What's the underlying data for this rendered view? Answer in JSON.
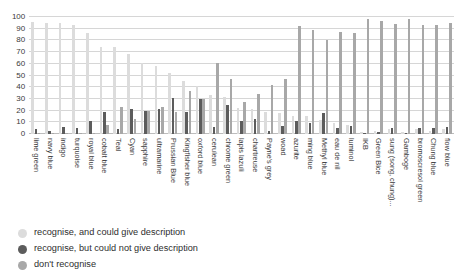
{
  "chart_data": {
    "type": "bar",
    "title": "",
    "subtitle": "",
    "xlabel": "",
    "ylabel": "",
    "ylim": [
      0,
      100
    ],
    "yticks": [
      0,
      10,
      20,
      30,
      40,
      50,
      60,
      70,
      80,
      90,
      100
    ],
    "grid": true,
    "legend_position": "bottom-left",
    "orientation": "vertical",
    "grouping": "grouped",
    "categories": [
      "lime green",
      "navy blue",
      "indigo",
      "turquoise",
      "royal blue",
      "cobalt blue",
      "Teal",
      "Cyan",
      "sapphire",
      "ultramarine",
      "Prussian Blue",
      "Kingfisher blue",
      "oxford blue",
      "cerulean",
      "chrome green",
      "lapis lazuli",
      "chartreuse",
      "Payne's grey",
      "woad",
      "azurite",
      "ming blue",
      "Methyl blue",
      "eau de nil",
      "luminol",
      "IKB",
      "Green Bice",
      "sung (song, chung)...",
      "Gamboge",
      "bromoscresol green",
      "Chung blue",
      "flow blue"
    ],
    "series": [
      {
        "name": "recognise, and could give description",
        "color": "#dcdcdc",
        "values": [
          96,
          95,
          95,
          93,
          86,
          74,
          74,
          68,
          61,
          58,
          52,
          45,
          41,
          33,
          32,
          22,
          21,
          19,
          18,
          15,
          15,
          12,
          9,
          8,
          2,
          3,
          4,
          2,
          4,
          3,
          4
        ]
      },
      {
        "name": "recognise, but could not give description",
        "color": "#5c5c5c",
        "values": [
          4,
          3,
          6,
          5,
          11,
          19,
          4,
          21,
          20,
          21,
          31,
          19,
          30,
          6,
          25,
          11,
          13,
          3,
          7,
          11,
          9,
          18,
          5,
          7,
          1,
          2,
          5,
          1,
          5,
          5,
          6
        ]
      },
      {
        "name": "don't recognise",
        "color": "#a8a8a8",
        "values": [
          1,
          1,
          1,
          1,
          1,
          8,
          23,
          13,
          20,
          23,
          19,
          37,
          30,
          61,
          47,
          27,
          34,
          42,
          47,
          92,
          89,
          80,
          87,
          86,
          98,
          97,
          94,
          98,
          93,
          93,
          95
        ]
      }
    ],
    "legend": [
      "recognise, and could give description",
      "recognise, but could not give description",
      "don't recognise"
    ]
  }
}
